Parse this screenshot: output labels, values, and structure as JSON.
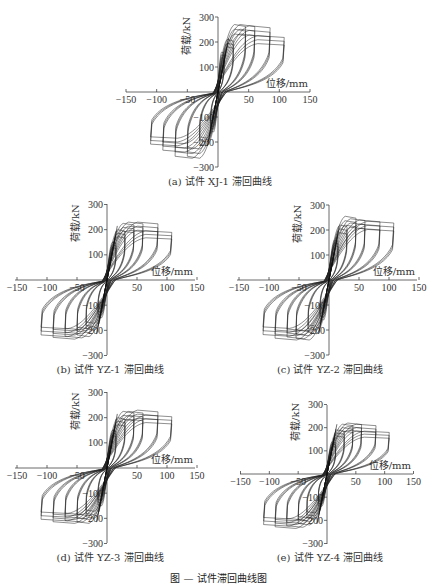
{
  "figure_caption": "图 — 试件滞回曲线图",
  "chart_data": [
    {
      "type": "line",
      "id": "a",
      "title": "(a) 试件 XJ-1 滞回曲线",
      "xlabel": "位移/mm",
      "ylabel": "荷载/kN",
      "xlim": [
        -150,
        150
      ],
      "ylim": [
        -300,
        300
      ],
      "xticks": [
        "-150",
        "-100",
        "-50",
        "50",
        "100",
        "150"
      ],
      "yticks": [
        "300",
        "200",
        "100",
        "-100",
        "-200",
        "-300"
      ],
      "grid": false,
      "peak_points": [
        [
          10,
          160
        ],
        [
          25,
          210
        ],
        [
          45,
          270
        ],
        [
          60,
          270
        ],
        [
          85,
          265
        ],
        [
          108,
          225
        ],
        [
          -12,
          -160
        ],
        [
          -30,
          -215
        ],
        [
          -50,
          -265
        ],
        [
          -70,
          -265
        ],
        [
          -90,
          -240
        ],
        [
          -110,
          -215
        ]
      ],
      "frame": {
        "x0": 126,
        "x1": 310,
        "y0": 92,
        "ytop": 17,
        "ybot": 167,
        "yaxis": 218
      }
    },
    {
      "type": "line",
      "id": "b",
      "title": "(b) 试件 YZ-1 滞回曲线",
      "xlabel": "位移/mm",
      "ylabel": "荷载/kN",
      "xlim": [
        -150,
        150
      ],
      "ylim": [
        -300,
        300
      ],
      "xticks": [
        "-150",
        "-100",
        "-50",
        "50",
        "100",
        "150"
      ],
      "yticks": [
        "300",
        "200",
        "100",
        "-100",
        "-200",
        "-300"
      ],
      "grid": false,
      "peak_points": [
        [
          15,
          150
        ],
        [
          30,
          200
        ],
        [
          45,
          225
        ],
        [
          60,
          230
        ],
        [
          85,
          230
        ],
        [
          108,
          195
        ],
        [
          -15,
          -150
        ],
        [
          -35,
          -200
        ],
        [
          -50,
          -225
        ],
        [
          -70,
          -230
        ],
        [
          -90,
          -235
        ],
        [
          -110,
          -225
        ]
      ],
      "frame": {
        "x0": 15,
        "x1": 195,
        "y0": 280,
        "ytop": 204,
        "ybot": 355,
        "yaxis": 107
      }
    },
    {
      "type": "line",
      "id": "c",
      "title": "(c) 试件 YZ-2 滞回曲线",
      "xlabel": "位移/mm",
      "ylabel": "荷载/kN",
      "xlim": [
        -150,
        150
      ],
      "ylim": [
        -300,
        300
      ],
      "xticks": [
        "-150",
        "-100",
        "-50",
        "50",
        "100",
        "150"
      ],
      "yticks": [
        "300",
        "200",
        "100",
        "-100",
        "-200",
        "-300"
      ],
      "grid": false,
      "peak_points": [
        [
          15,
          160
        ],
        [
          30,
          220
        ],
        [
          45,
          255
        ],
        [
          60,
          245
        ],
        [
          85,
          240
        ],
        [
          108,
          235
        ],
        [
          -15,
          -160
        ],
        [
          -35,
          -215
        ],
        [
          -55,
          -240
        ],
        [
          -70,
          -235
        ],
        [
          -90,
          -240
        ],
        [
          -110,
          -225
        ]
      ],
      "frame": {
        "x0": 237,
        "x1": 417,
        "y0": 280,
        "ytop": 205,
        "ybot": 355,
        "yaxis": 329
      }
    },
    {
      "type": "line",
      "id": "d",
      "title": "(d) 试件 YZ-3 滞回曲线",
      "xlabel": "位移/mm",
      "ylabel": "荷载/kN",
      "xlim": [
        -150,
        150
      ],
      "ylim": [
        -300,
        300
      ],
      "xticks": [
        "-150",
        "-100",
        "-50",
        "50",
        "100",
        "150"
      ],
      "yticks": [
        "300",
        "200",
        "100",
        "-100",
        "-200",
        "-300"
      ],
      "grid": false,
      "peak_points": [
        [
          15,
          150
        ],
        [
          30,
          200
        ],
        [
          45,
          225
        ],
        [
          60,
          225
        ],
        [
          85,
          230
        ],
        [
          108,
          210
        ],
        [
          -15,
          -150
        ],
        [
          -35,
          -200
        ],
        [
          -50,
          -220
        ],
        [
          -70,
          -215
        ],
        [
          -90,
          -220
        ],
        [
          -110,
          -210
        ]
      ],
      "frame": {
        "x0": 15,
        "x1": 195,
        "y0": 468,
        "ytop": 392,
        "ybot": 543,
        "yaxis": 107
      }
    },
    {
      "type": "line",
      "id": "e",
      "title": "(e) 试件 YZ-4 滞回曲线",
      "xlabel": "位移/mm",
      "ylabel": "荷载/kN",
      "xlim": [
        -150,
        150
      ],
      "ylim": [
        -300,
        300
      ],
      "xticks": [
        "-150",
        "-100",
        "-50",
        "50",
        "100",
        "150"
      ],
      "yticks": [
        "300",
        "200",
        "100",
        "-100",
        "-200",
        "-300"
      ],
      "grid": false,
      "peak_points": [
        [
          15,
          140
        ],
        [
          30,
          190
        ],
        [
          45,
          215
        ],
        [
          60,
          220
        ],
        [
          85,
          215
        ],
        [
          108,
          185
        ],
        [
          -15,
          -140
        ],
        [
          -35,
          -195
        ],
        [
          -50,
          -220
        ],
        [
          -70,
          -230
        ],
        [
          -90,
          -235
        ],
        [
          -110,
          -225
        ]
      ],
      "frame": {
        "x0": 240,
        "x1": 413,
        "y0": 474,
        "ytop": 405,
        "ybot": 544,
        "yaxis": 327
      }
    }
  ]
}
